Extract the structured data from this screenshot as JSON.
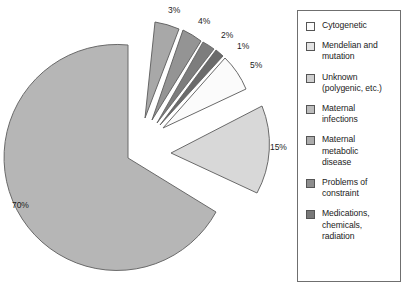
{
  "chart_data": {
    "type": "pie",
    "title": "",
    "subtitle": "",
    "xlabel": "",
    "ylabel": "",
    "legend_position": "right",
    "grid": false,
    "exploded": true,
    "total": 100,
    "unit": "%",
    "categories": [
      "Cytogenetic",
      "Mendelian and mutation",
      "Unknown (polygenic, etc.)",
      "Maternal infections",
      "Maternal metabolic disease",
      "Problems of constraint",
      "Medications, chemicals, radiation"
    ],
    "values": [
      5,
      15,
      70,
      3,
      4,
      2,
      1
    ],
    "labels": [
      "5%",
      "15%",
      "70%",
      "3%",
      "4%",
      "2%",
      "1%"
    ],
    "colors": [
      "#fbfbfb",
      "#d8d8d8",
      "#b6b6b6",
      "#a8a8a8",
      "#949494",
      "#7d7d7d",
      "#6b6b6b"
    ],
    "slices": [
      {
        "name": "Cytogenetic",
        "value": 5,
        "label": "5%",
        "color": "#fbfbfb"
      },
      {
        "name": "Mendelian and mutation",
        "value": 15,
        "label": "15%",
        "color": "#d8d8d8"
      },
      {
        "name": "Unknown (polygenic, etc.)",
        "value": 70,
        "label": "70%",
        "color": "#b6b6b6"
      },
      {
        "name": "Maternal infections",
        "value": 3,
        "label": "3%",
        "color": "#a8a8a8"
      },
      {
        "name": "Maternal metabolic disease",
        "value": 4,
        "label": "4%",
        "color": "#949494"
      },
      {
        "name": "Problems of constraint",
        "value": 2,
        "label": "2%",
        "color": "#7d7d7d"
      },
      {
        "name": "Medications, chemicals, radiation",
        "value": 1,
        "label": "1%",
        "color": "#6b6b6b"
      }
    ]
  },
  "slice_labels": {
    "three": "3%",
    "four": "4%",
    "two": "2%",
    "one": "1%",
    "five": "5%",
    "fifteen": "15%",
    "seventy": "70%"
  },
  "legend": {
    "items": [
      {
        "label": "Cytogenetic",
        "color": "#fbfbfb"
      },
      {
        "label": "Mendelian and\nmutation",
        "color": "#e3e3e3"
      },
      {
        "label": "Unknown\n(polygenic, etc.)",
        "color": "#cfcfcf"
      },
      {
        "label": "Maternal\ninfections",
        "color": "#bcbcbc"
      },
      {
        "label": "Maternal\nmetabolic\ndisease",
        "color": "#ababab"
      },
      {
        "label": "Problems of\nconstraint",
        "color": "#8d8d8d"
      },
      {
        "label": "Medications,\nchemicals,\nradiation",
        "color": "#787878"
      }
    ]
  },
  "style": {
    "stroke": "#555555",
    "background": "#ffffff",
    "text": "#1b1b1b"
  }
}
